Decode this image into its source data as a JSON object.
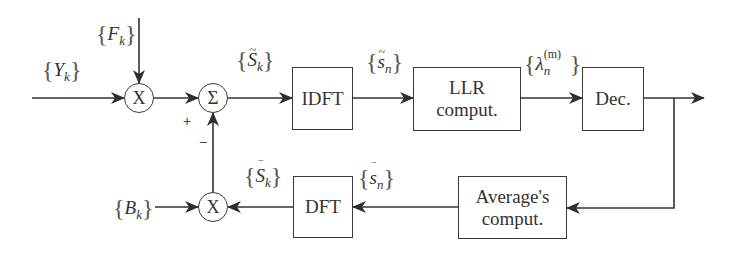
{
  "diagram": {
    "type": "block-diagram",
    "line_color": "#333333",
    "background": "#ffffff",
    "blocks": [
      {
        "id": "idft",
        "label": "IDFT"
      },
      {
        "id": "llr",
        "label_line1": "LLR",
        "label_line2": "comput."
      },
      {
        "id": "dec",
        "label": "Dec."
      },
      {
        "id": "dft",
        "label": "DFT"
      },
      {
        "id": "avg",
        "label_line1": "Average's",
        "label_line2": "comput."
      }
    ],
    "operators": {
      "mult_top": "X",
      "sum": "Σ",
      "mult_bottom": "X"
    },
    "signals": {
      "Y": {
        "base": "Y",
        "sub": "k"
      },
      "F": {
        "base": "F",
        "sub": "k"
      },
      "B": {
        "base": "B",
        "sub": "k"
      },
      "S_tilde": {
        "base": "S",
        "sub": "k",
        "accent": "~"
      },
      "s_tilde": {
        "base": "s",
        "sub": "n",
        "accent": "~"
      },
      "lambda": {
        "base": "λ",
        "sub": "n",
        "sup": "(m)"
      },
      "S_bar": {
        "base": "S",
        "sub": "k",
        "accent": "‾"
      },
      "s_bar": {
        "base": "s",
        "sub": "n",
        "accent": "‾"
      }
    },
    "brace_open": "{",
    "brace_close": "}",
    "signs": {
      "plus": "+",
      "minus": "−"
    }
  }
}
